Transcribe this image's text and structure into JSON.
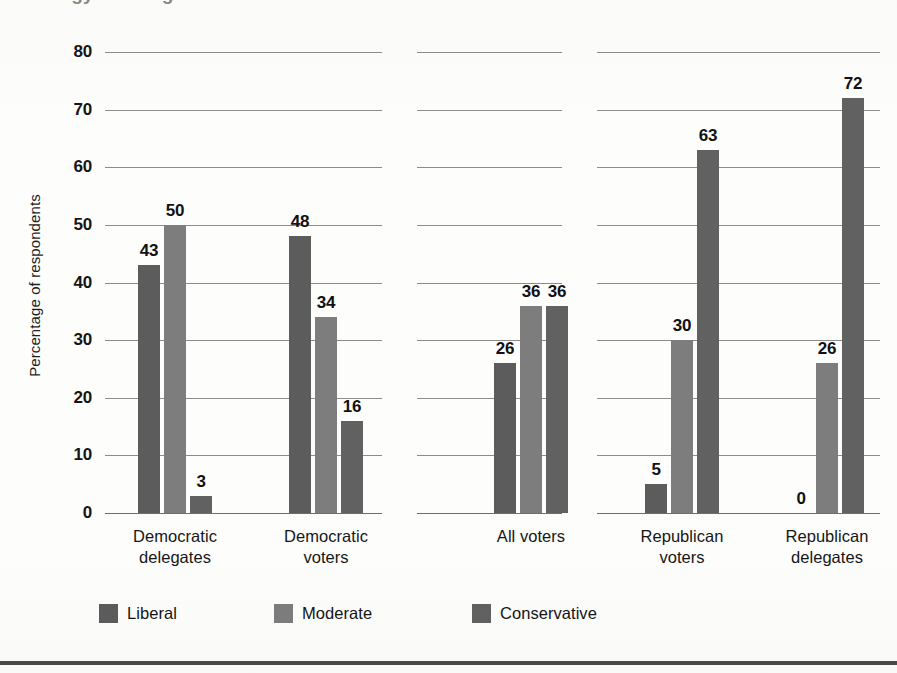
{
  "figure": {
    "title_cutoff": "Ideology of delegates and voters",
    "footer_rule": true
  },
  "axis": {
    "y_title": "Percentage of respondents",
    "y_ticks": [
      "80",
      "70",
      "60",
      "50",
      "40",
      "30",
      "20",
      "10",
      "0"
    ]
  },
  "legend": {
    "items": [
      {
        "label": "Liberal",
        "color": "#5c5c5c",
        "key": "liberal"
      },
      {
        "label": "Moderate",
        "color": "#7d7d7d",
        "key": "moderate"
      },
      {
        "label": "Conservative",
        "color": "#616161",
        "key": "conservative"
      }
    ]
  },
  "groups": [
    {
      "line1": "Democratic",
      "line2": "delegates",
      "values": [
        "43",
        "50",
        "3"
      ]
    },
    {
      "line1": "Democratic",
      "line2": "voters",
      "values": [
        "48",
        "34",
        "16"
      ]
    },
    {
      "line1": "All voters",
      "line2": "",
      "values": [
        "26",
        "36",
        "36"
      ]
    },
    {
      "line1": "Republican",
      "line2": "voters",
      "values": [
        "5",
        "30",
        "63"
      ]
    },
    {
      "line1": "Republican",
      "line2": "delegates",
      "values": [
        "0",
        "26",
        "72"
      ]
    }
  ],
  "chart_data": {
    "type": "bar",
    "title": "Ideology of delegates and voters",
    "xlabel": "",
    "ylabel": "Percentage of respondents",
    "ylim": [
      0,
      80
    ],
    "yticks": [
      0,
      10,
      20,
      30,
      40,
      50,
      60,
      70,
      80
    ],
    "grid": true,
    "grid_style": "horizontal gridlines, broken into three panel segments",
    "legend_position": "bottom-left",
    "categories": [
      "Democratic delegates",
      "Democratic voters",
      "All voters",
      "Republican voters",
      "Republican delegates"
    ],
    "series": [
      {
        "name": "Liberal",
        "color": "#5c5c5c",
        "values": [
          43,
          48,
          26,
          5,
          0
        ]
      },
      {
        "name": "Moderate",
        "color": "#7d7d7d",
        "values": [
          50,
          34,
          36,
          30,
          26
        ]
      },
      {
        "name": "Conservative",
        "color": "#616161",
        "values": [
          3,
          16,
          36,
          63,
          72
        ]
      }
    ],
    "data_labels": true
  }
}
